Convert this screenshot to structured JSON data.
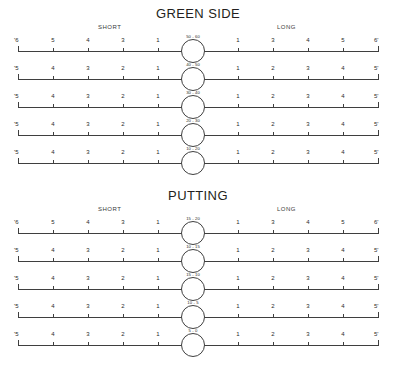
{
  "document": {
    "title": "Golf Distance Control Practice Sheet"
  },
  "sections": [
    {
      "id": "green-side",
      "title": "GREEN SIDE",
      "short_label": "SHORT",
      "long_label": "LONG",
      "rows": [
        {
          "hub_label": "50 - 60",
          "left_end": "'6",
          "right_end": "6'",
          "left_ticks": [
            "5",
            "4",
            "3",
            "1"
          ],
          "right_ticks": [
            "1",
            "3",
            "4",
            "5"
          ]
        },
        {
          "hub_label": "40 - 50",
          "left_end": "'5",
          "right_end": "5'",
          "left_ticks": [
            "4",
            "3",
            "2",
            "1"
          ],
          "right_ticks": [
            "1",
            "2",
            "3",
            "4"
          ]
        },
        {
          "hub_label": "30 - 40",
          "left_end": "'5",
          "right_end": "5'",
          "left_ticks": [
            "4",
            "3",
            "2",
            "1"
          ],
          "right_ticks": [
            "1",
            "2",
            "3",
            "4"
          ]
        },
        {
          "hub_label": "20 - 30",
          "left_end": "'5",
          "right_end": "5'",
          "left_ticks": [
            "4",
            "3",
            "2",
            "1"
          ],
          "right_ticks": [
            "1",
            "2",
            "3",
            "4"
          ]
        },
        {
          "hub_label": "10 - 20",
          "left_end": "'5",
          "right_end": "5'",
          "left_ticks": [
            "4",
            "3",
            "2",
            "1"
          ],
          "right_ticks": [
            "1",
            "2",
            "3",
            "4"
          ]
        }
      ]
    },
    {
      "id": "putting",
      "title": "PUTTING",
      "short_label": "SHORT",
      "long_label": "LONG",
      "rows": [
        {
          "hub_label": "15 - 20",
          "left_end": "'6",
          "right_end": "6'",
          "left_ticks": [
            "5",
            "4",
            "3",
            "1"
          ],
          "right_ticks": [
            "1",
            "3",
            "4",
            "5"
          ]
        },
        {
          "hub_label": "10 - 15",
          "left_end": "'5",
          "right_end": "5'",
          "left_ticks": [
            "4",
            "3",
            "2",
            "1"
          ],
          "right_ticks": [
            "1",
            "2",
            "3",
            "4"
          ]
        },
        {
          "hub_label": "15 - 10",
          "left_end": "'5",
          "right_end": "5'",
          "left_ticks": [
            "4",
            "3",
            "2",
            "1"
          ],
          "right_ticks": [
            "1",
            "2",
            "3",
            "4"
          ]
        },
        {
          "hub_label": "10 - 5",
          "left_end": "'5",
          "right_end": "5'",
          "left_ticks": [
            "4",
            "3",
            "2",
            "1"
          ],
          "right_ticks": [
            "1",
            "2",
            "3",
            "4"
          ]
        },
        {
          "hub_label": "5 - 0",
          "left_end": "'5",
          "right_end": "5'",
          "left_ticks": [
            "4",
            "3",
            "2",
            "1"
          ],
          "right_ticks": [
            "1",
            "2",
            "3",
            "4"
          ]
        }
      ]
    }
  ],
  "geometry": {
    "left_axis_start": 18,
    "left_axis_end": 193,
    "right_axis_start": 203,
    "right_axis_end": 378
  }
}
